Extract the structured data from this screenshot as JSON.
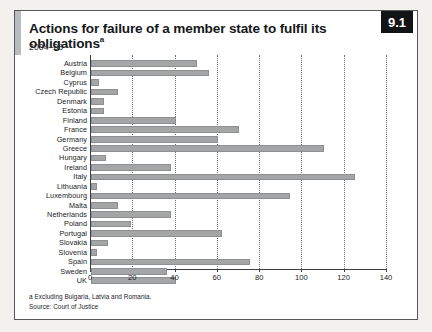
{
  "figure": {
    "badge": "9.1",
    "title": "Actions for failure of a member state to fulfil its obligations",
    "title_superscript": "a",
    "subtitle": "2004–08",
    "footnote_a": "a Excluding Bulgaria, Latvia and Romania.",
    "footnote_source": "Source: Court of Justice",
    "bar_color": "#a3a5a6",
    "badge_bg": "#111315",
    "accent_color": "#b9bcbe"
  },
  "chart_data": {
    "type": "bar",
    "orientation": "horizontal",
    "title": "Actions for failure of a member state to fulfil its obligations",
    "subtitle": "2004–08",
    "xlabel": "",
    "ylabel": "",
    "xlim": [
      0,
      140
    ],
    "xticks": [
      0,
      20,
      40,
      60,
      80,
      100,
      120,
      140
    ],
    "grid": true,
    "legend": false,
    "categories": [
      "Austria",
      "Belgium",
      "Cyprus",
      "Czech Republic",
      "Denmark",
      "Estonia",
      "Finland",
      "France",
      "Germany",
      "Greece",
      "Hungary",
      "Ireland",
      "Italy",
      "Lithuania",
      "Luxembourg",
      "Malta",
      "Netherlands",
      "Poland",
      "Portugal",
      "Slovakia",
      "Slovenia",
      "Spain",
      "Sweden",
      "UK"
    ],
    "values": [
      50,
      56,
      4,
      13,
      6,
      6,
      40,
      70,
      60,
      110,
      7,
      38,
      125,
      3,
      94,
      13,
      38,
      19,
      62,
      8,
      3,
      75,
      36,
      40
    ]
  }
}
